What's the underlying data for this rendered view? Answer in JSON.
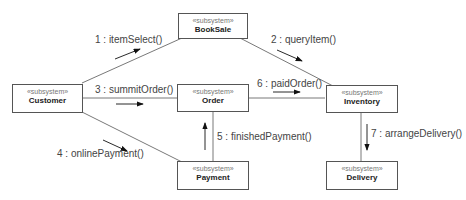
{
  "diagram": {
    "type": "UML communication diagram",
    "nodes": [
      {
        "id": "bookSale",
        "stereotype": "«subsystem»",
        "name": "BookSale"
      },
      {
        "id": "customer",
        "stereotype": "«subsystem»",
        "name": "Customer"
      },
      {
        "id": "order",
        "stereotype": "«subsystem»",
        "name": "Order"
      },
      {
        "id": "inventory",
        "stereotype": "«subsystem»",
        "name": "Inventory"
      },
      {
        "id": "payment",
        "stereotype": "«subsystem»",
        "name": "Payment"
      },
      {
        "id": "delivery",
        "stereotype": "«subsystem»",
        "name": "Delivery"
      }
    ],
    "messages": [
      {
        "label": "1 : itemSelect()",
        "from": "Customer",
        "to": "BookSale"
      },
      {
        "label": "2 : queryItem()",
        "from": "BookSale",
        "to": "Inventory"
      },
      {
        "label": "3 : summitOrder()",
        "from": "Customer",
        "to": "Order"
      },
      {
        "label": "4 : onlinePayment()",
        "from": "Customer",
        "to": "Payment"
      },
      {
        "label": "5 : finishedPayment()",
        "from": "Payment",
        "to": "Order"
      },
      {
        "label": "6 : paidOrder()",
        "from": "Order",
        "to": "Inventory"
      },
      {
        "label": "7 : arrangeDelivery()",
        "from": "Inventory",
        "to": "Delivery"
      }
    ]
  }
}
